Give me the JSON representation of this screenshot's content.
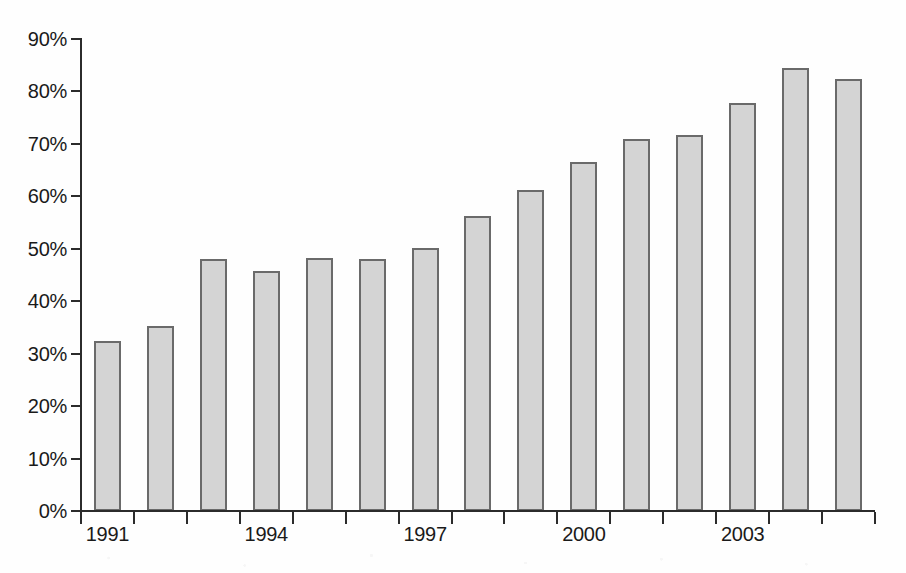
{
  "chart_data": {
    "type": "bar",
    "title": "",
    "subtitle": "",
    "xlabel": "",
    "ylabel": "",
    "categories": [
      "1991",
      "1992",
      "1993",
      "1994",
      "1995",
      "1996",
      "1997",
      "1998",
      "1999",
      "2000",
      "2001",
      "2002",
      "2003",
      "2004",
      "2005"
    ],
    "values": [
      32.5,
      35.3,
      48.0,
      45.8,
      48.2,
      48.1,
      50.1,
      56.2,
      61.2,
      66.6,
      71.0,
      71.6,
      77.8,
      84.5,
      82.4
    ],
    "value_unit": "%",
    "ylim": [
      0,
      90
    ],
    "y_tick_step": 10,
    "y_tick_labels": [
      "90%",
      "80%",
      "70%",
      "60%",
      "50%",
      "40%",
      "30%",
      "20%",
      "10%",
      "0%"
    ],
    "y_tick_values": [
      90,
      80,
      70,
      60,
      50,
      40,
      30,
      20,
      10,
      0
    ],
    "x_tick_labels_visible": [
      "1991",
      "1994",
      "1997",
      "2000",
      "2003"
    ],
    "x_tick_label_indices": [
      0,
      3,
      6,
      9,
      12
    ],
    "x_tick_count": 15,
    "grid": false,
    "legend": false,
    "legend_position": "none",
    "annotations": [],
    "series": [
      {
        "name": "",
        "values": [
          32.5,
          35.3,
          48.0,
          45.8,
          48.2,
          48.1,
          50.1,
          56.2,
          61.2,
          66.6,
          71.0,
          71.6,
          77.8,
          84.5,
          82.4
        ]
      }
    ]
  },
  "style": {
    "bar_fill": "#d4d4d4",
    "bar_border": "#6a6a6a",
    "axis_color": "#2b2b2b",
    "text_color": "#1a1a1a",
    "background": "#fefefe"
  }
}
